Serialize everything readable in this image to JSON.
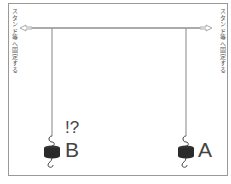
{
  "diagram": {
    "left_anchor_label": "スタンド等へ固定する",
    "right_anchor_label": "スタンド等へ固定する",
    "weights": [
      {
        "label": "B",
        "annotation": "!?"
      },
      {
        "label": "A",
        "annotation": ""
      }
    ],
    "colors": {
      "line": "#aaaaaa",
      "weight": "#2a2a2a",
      "frame": "#999999",
      "text": "#444444"
    }
  }
}
